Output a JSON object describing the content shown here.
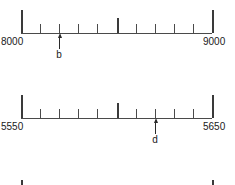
{
  "figure": {
    "type": "number-lines",
    "background_color": "#ffffff",
    "line_color": "#4a4a4a",
    "text_color": "#1a1a1a"
  },
  "lines": [
    {
      "id": "line-1",
      "start_label": "8000",
      "end_label": "9000",
      "start_value": 8000,
      "end_value": 9000,
      "interval_count": 10,
      "tick_step": 100,
      "baseline_y": 33,
      "left_x": 21,
      "right_x": 212,
      "end_tick_height": 23,
      "mid_tick_height": 15,
      "minor_tick_height": 9,
      "label_y": 36,
      "pointer": {
        "label": "b",
        "x": 59,
        "value": 8200,
        "arrow_top": 33,
        "label_y": 49
      }
    },
    {
      "id": "line-2",
      "start_label": "5550",
      "end_label": "5650",
      "start_value": 5550,
      "end_value": 5650,
      "interval_count": 10,
      "tick_step": 10,
      "baseline_y": 118,
      "left_x": 21,
      "right_x": 212,
      "end_tick_height": 23,
      "mid_tick_height": 15,
      "minor_tick_height": 9,
      "label_y": 121,
      "pointer": {
        "label": "d",
        "x": 155,
        "value": 5620,
        "arrow_top": 118,
        "label_y": 134
      }
    },
    {
      "id": "line-3",
      "start_label": "",
      "end_label": "",
      "start_value": null,
      "end_value": null,
      "interval_count": 10,
      "tick_step": null,
      "baseline_y": 203,
      "left_x": 21,
      "right_x": 212,
      "end_tick_height": 23,
      "mid_tick_height": 15,
      "minor_tick_height": 9,
      "label_y": 206,
      "pointer": null,
      "clipped": true
    }
  ]
}
